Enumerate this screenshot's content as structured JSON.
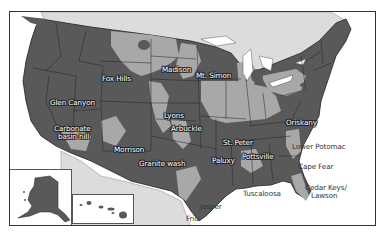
{
  "map": {
    "type": "aquifer-map",
    "region": "United States",
    "colors": {
      "aquifer_dark": "#5a5a5a",
      "aquifer_light": "#a8a8a8",
      "non_aquifer_land": "#d9d9d9",
      "water": "#ffffff",
      "border": "#222222"
    },
    "labels": [
      {
        "id": "fox-hills",
        "text": "Fox Hills"
      },
      {
        "id": "madison",
        "text": "Madison"
      },
      {
        "id": "mt-simon",
        "text": "Mt. Simon"
      },
      {
        "id": "glen-canyon",
        "text": "Glen Canyon"
      },
      {
        "id": "lyons",
        "text": "Lyons"
      },
      {
        "id": "arbuckle",
        "text": "Arbuckle"
      },
      {
        "id": "carbonate-basin-hill-1",
        "text": "Carbonate"
      },
      {
        "id": "carbonate-basin-hill-2",
        "text": "basin hill"
      },
      {
        "id": "morrison",
        "text": "Morrison"
      },
      {
        "id": "granite-wash",
        "text": "Granite wash"
      },
      {
        "id": "st-peter",
        "text": "St. Peter"
      },
      {
        "id": "oriskany",
        "text": "Oriskany"
      },
      {
        "id": "pottsville",
        "text": "Pottsville"
      },
      {
        "id": "paluxy",
        "text": "Paluxy"
      },
      {
        "id": "lower-potomac",
        "text": "Lower Potomac"
      },
      {
        "id": "cape-fear",
        "text": "Cape Fear"
      },
      {
        "id": "tuscaloosa",
        "text": "Tuscaloosa"
      },
      {
        "id": "cedar-keys-lawson-1",
        "text": "Cedar Keys/"
      },
      {
        "id": "cedar-keys-lawson-2",
        "text": "Lawson"
      },
      {
        "id": "jasper",
        "text": "Jasper"
      },
      {
        "id": "frio",
        "text": "Frio"
      }
    ],
    "insets": [
      {
        "id": "alaska",
        "name": "Alaska"
      },
      {
        "id": "hawaii",
        "name": "Hawaii"
      }
    ]
  }
}
